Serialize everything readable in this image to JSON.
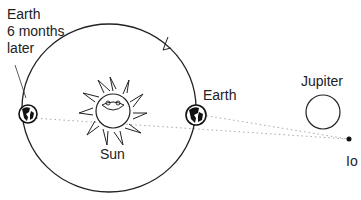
{
  "labels": {
    "earth_later_line1": "Earth",
    "earth_later_line2": "6 months",
    "earth_later_line3": "later",
    "sun": "Sun",
    "earth": "Earth",
    "jupiter": "Jupiter",
    "io": "Io"
  },
  "colors": {
    "line": "#222222",
    "dotted": "#999999",
    "background": "#ffffff"
  }
}
